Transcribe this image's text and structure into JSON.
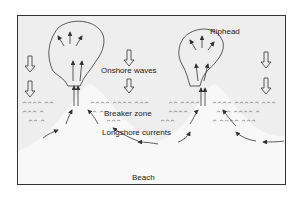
{
  "diagram": {
    "labels": {
      "riphead": "Riphead",
      "onshore_waves": "Onshore waves",
      "breaker_zone": "Breaker zone",
      "longshore_currents": "Longshore currents",
      "beach": "Beach"
    },
    "colors": {
      "water": "#eeeeee",
      "beach": "#f8f8f8",
      "stroke": "#333333",
      "frame": "#333333"
    }
  }
}
